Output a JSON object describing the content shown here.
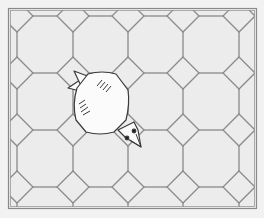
{
  "board": {
    "label": "octagon-square tiled floor",
    "frame": {
      "x": 8,
      "y": 8,
      "width": 249,
      "height": 201
    },
    "tile_fill": "#ececec",
    "line_color": "#8a8a8a",
    "background": "#f2f2f2",
    "diamond_half": 16,
    "diamond_columns_x": [
      17,
      73,
      128,
      183,
      239
    ],
    "diamond_rows_y": [
      16,
      73,
      130,
      187
    ]
  },
  "player": {
    "label": "bird",
    "body_fill": "#fbfbfb",
    "outline": "#3a3a3a",
    "facing": "down-right"
  }
}
